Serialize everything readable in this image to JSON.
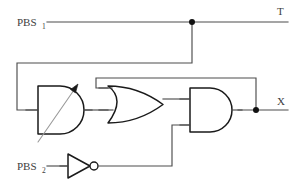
{
  "diagram": {
    "background_color": "#ffffff",
    "wire_color": "#4d4d4d",
    "gate_outline_color": "#1a1a1a",
    "gate_fill_color": "#ffffff",
    "junction_color": "#111111",
    "arrow_color": "#9a9a9a",
    "labels": {
      "input_1_base": "PBS",
      "input_1_sub": "1",
      "input_2_base": "PBS",
      "input_2_sub": "2",
      "output_top": "T",
      "output_right": "X"
    },
    "gates": [
      {
        "id": "and-variable",
        "type": "AND",
        "name": "variable-and-gate",
        "annotation": "tunable-arrow",
        "inputs": 2,
        "outputs": 1
      },
      {
        "id": "or",
        "type": "OR",
        "name": "or-gate",
        "inputs": 2,
        "outputs": 1
      },
      {
        "id": "and",
        "type": "AND",
        "name": "and-gate",
        "inputs": 2,
        "outputs": 1
      },
      {
        "id": "not",
        "type": "NOT",
        "name": "not-gate",
        "inputs": 1,
        "outputs": 1
      }
    ],
    "junctions": [
      {
        "name": "t-line-tap",
        "x": 192,
        "y": 22
      },
      {
        "name": "x-output-tap",
        "x": 256,
        "y": 110
      }
    ],
    "nets": [
      {
        "name": "pbs1-to-T",
        "from": "PBS1",
        "to": "T"
      },
      {
        "name": "t-tap-to-variable-and-input-a",
        "from": "t-line-tap",
        "to": "variable-and-gate.in0"
      },
      {
        "name": "variable-and-out-to-or-in-b",
        "from": "variable-and-gate.out",
        "to": "or-gate.in1"
      },
      {
        "name": "x-feedback-to-or-in-a",
        "from": "x-output-tap",
        "to": "or-gate.in0"
      },
      {
        "name": "or-out-to-and-in-a",
        "from": "or-gate.out",
        "to": "and-gate.in0"
      },
      {
        "name": "pbs2-to-not",
        "from": "PBS2",
        "to": "not-gate.in0"
      },
      {
        "name": "not-out-to-and-in-b",
        "from": "not-gate.out",
        "to": "and-gate.in1"
      },
      {
        "name": "and-out-to-X",
        "from": "and-gate.out",
        "to": "X"
      }
    ]
  }
}
